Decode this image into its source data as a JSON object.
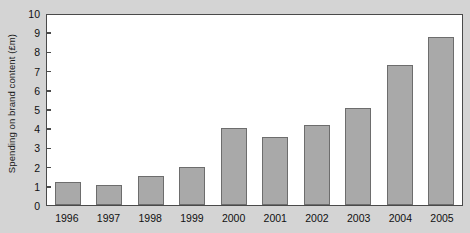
{
  "chart_data": {
    "type": "bar",
    "title": "",
    "xlabel": "",
    "ylabel": "Spending on brand content (£m)",
    "categories": [
      "1996",
      "1997",
      "1998",
      "1999",
      "2000",
      "2001",
      "2002",
      "2003",
      "2004",
      "2005"
    ],
    "values": [
      1.2,
      1.05,
      1.5,
      2.0,
      4.0,
      3.55,
      4.15,
      5.05,
      7.3,
      8.75
    ],
    "ylim": [
      0,
      10
    ],
    "yticks": [
      0,
      1,
      2,
      3,
      4,
      5,
      6,
      7,
      8,
      9,
      10
    ],
    "ytick_labels": [
      "0",
      "1",
      "2",
      "3",
      "4",
      "5",
      "6",
      "7",
      "8",
      "9",
      "10"
    ],
    "grid": false,
    "legend": null,
    "bar_color": "#a9a9a9",
    "bar_border_color": "#6d6d6d",
    "plot_background": "#ffffff",
    "figure_background": "#d4d4d4",
    "axis_color": "#4a4a4a"
  }
}
